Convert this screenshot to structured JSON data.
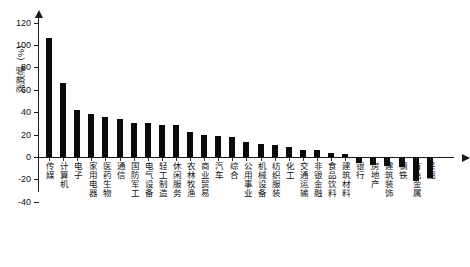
{
  "chart_data": {
    "type": "bar",
    "title": "",
    "xlabel": "",
    "ylabel": "涨跌幅（%）",
    "ylim": [
      -40,
      130
    ],
    "yticks": [
      -40,
      -20,
      0,
      20,
      40,
      60,
      80,
      100,
      120
    ],
    "ytick_labels": [
      "-40",
      "-20",
      "0",
      "20",
      "40",
      "60",
      "80",
      "100",
      "120"
    ],
    "grid": false,
    "legend": null,
    "bar_color": "#0a0a0a",
    "categories": [
      "传媒",
      "计算机",
      "电子",
      "家用电器",
      "医药生物",
      "通信",
      "国防军工",
      "电气设备",
      "轻工制造",
      "休闲服务",
      "农林牧渔",
      "商业贸易",
      "汽车",
      "综合",
      "公用事业",
      "机械设备",
      "纺织服装",
      "化工",
      "交通运输",
      "非银金融",
      "食品饮料",
      "建筑材料",
      "银行",
      "房地产",
      "建筑装饰",
      "钢铁",
      "有色金属",
      "采掘"
    ],
    "values": [
      106,
      66,
      42,
      38.5,
      36,
      34,
      30.5,
      30,
      29,
      29,
      22,
      20,
      19,
      18,
      13,
      11.5,
      10.5,
      9,
      6.5,
      6,
      4,
      3,
      -5,
      -7,
      -8,
      -9,
      -21,
      -19
    ]
  }
}
